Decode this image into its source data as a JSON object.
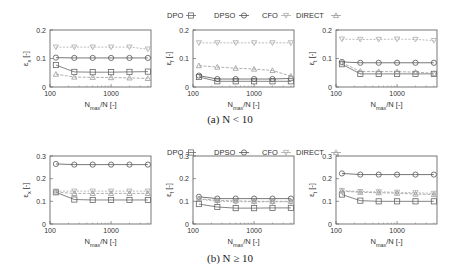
{
  "legend": [
    {
      "name": "DPO",
      "marker": "square",
      "color": "#666666"
    },
    {
      "name": "DPSO",
      "marker": "circle",
      "color": "#555555"
    },
    {
      "name": "CFO",
      "marker": "triangle-down",
      "color": "#aaaaaa"
    },
    {
      "name": "DIRECT",
      "marker": "triangle-up",
      "color": "#999999"
    }
  ],
  "captions": [
    "(a) N < 10",
    "(b) N ≥ 10"
  ],
  "chart_data": [
    {
      "type": "line",
      "row": 0,
      "ylabel": "εx [-]",
      "xlabel": "Nmax/N [-]",
      "xscale": "log",
      "xlim": [
        100,
        4500
      ],
      "ylim": [
        0,
        0.2
      ],
      "xticks": [
        100,
        1000
      ],
      "xtick_labels": [
        "100",
        "1000"
      ],
      "yticks": [
        0,
        0.1,
        0.2
      ],
      "ytick_labels": [
        "0",
        "0.1",
        "0.2"
      ],
      "x": [
        125,
        250,
        500,
        1000,
        2000,
        4000
      ],
      "series": [
        {
          "name": "DPO",
          "values": [
            0.077,
            0.053,
            0.052,
            0.052,
            0.053,
            0.054
          ]
        },
        {
          "name": "DPSO",
          "values": [
            0.103,
            0.102,
            0.102,
            0.102,
            0.102,
            0.102
          ]
        },
        {
          "name": "CFO",
          "values": [
            0.14,
            0.14,
            0.14,
            0.14,
            0.14,
            0.133
          ]
        },
        {
          "name": "DIRECT",
          "values": [
            0.045,
            0.035,
            0.034,
            0.033,
            0.032,
            0.03
          ]
        }
      ]
    },
    {
      "type": "line",
      "row": 0,
      "ylabel": "εf [-]",
      "xlabel": "Nmax/N [-]",
      "xscale": "log",
      "xlim": [
        100,
        4500
      ],
      "ylim": [
        0,
        0.2
      ],
      "xticks": [
        100,
        1000
      ],
      "xtick_labels": [
        "100",
        "1000"
      ],
      "yticks": [
        0,
        0.1,
        0.2
      ],
      "ytick_labels": [
        "0",
        "0.1",
        "0.2"
      ],
      "x": [
        125,
        250,
        500,
        1000,
        2000,
        4000
      ],
      "series": [
        {
          "name": "DPO",
          "values": [
            0.035,
            0.02,
            0.02,
            0.02,
            0.02,
            0.02
          ]
        },
        {
          "name": "DPSO",
          "values": [
            0.04,
            0.028,
            0.028,
            0.028,
            0.028,
            0.03
          ]
        },
        {
          "name": "CFO",
          "values": [
            0.155,
            0.155,
            0.155,
            0.155,
            0.155,
            0.155
          ]
        },
        {
          "name": "DIRECT",
          "values": [
            0.075,
            0.07,
            0.066,
            0.063,
            0.058,
            0.038
          ]
        }
      ]
    },
    {
      "type": "line",
      "row": 0,
      "ylabel": "εt [-]",
      "xlabel": "Nmax/N [-]",
      "xscale": "log",
      "xlim": [
        100,
        4500
      ],
      "ylim": [
        0,
        0.2
      ],
      "xticks": [
        100,
        1000
      ],
      "xtick_labels": [
        "100",
        "1000"
      ],
      "yticks": [
        0,
        0.1,
        0.2
      ],
      "ytick_labels": [
        "0",
        "0.1",
        "0.2"
      ],
      "x": [
        125,
        250,
        500,
        1000,
        2000,
        4000
      ],
      "series": [
        {
          "name": "DPO",
          "values": [
            0.08,
            0.046,
            0.046,
            0.046,
            0.046,
            0.046
          ]
        },
        {
          "name": "DPSO",
          "values": [
            0.088,
            0.085,
            0.085,
            0.085,
            0.085,
            0.085
          ]
        },
        {
          "name": "CFO",
          "values": [
            0.168,
            0.167,
            0.167,
            0.168,
            0.167,
            0.163
          ]
        },
        {
          "name": "DIRECT",
          "values": [
            0.085,
            0.055,
            0.054,
            0.054,
            0.052,
            0.048
          ]
        }
      ]
    },
    {
      "type": "line",
      "row": 1,
      "ylabel": "εx [-]",
      "xlabel": "Nmax/N [-]",
      "xscale": "log",
      "xlim": [
        100,
        4500
      ],
      "ylim": [
        0,
        0.3
      ],
      "xticks": [
        100,
        1000
      ],
      "xtick_labels": [
        "100",
        "1000"
      ],
      "yticks": [
        0,
        0.1,
        0.2,
        0.3
      ],
      "ytick_labels": [
        "0",
        "0.1",
        "0.2",
        "0.3"
      ],
      "x": [
        125,
        250,
        500,
        1000,
        2000,
        4000
      ],
      "series": [
        {
          "name": "DPO",
          "values": [
            0.14,
            0.108,
            0.106,
            0.106,
            0.106,
            0.106
          ]
        },
        {
          "name": "DPSO",
          "values": [
            0.265,
            0.262,
            0.262,
            0.262,
            0.262,
            0.262
          ]
        },
        {
          "name": "CFO",
          "values": [
            0.145,
            0.145,
            0.145,
            0.145,
            0.145,
            0.145
          ]
        },
        {
          "name": "DIRECT",
          "values": [
            0.14,
            0.135,
            0.135,
            0.135,
            0.135,
            0.135
          ]
        }
      ]
    },
    {
      "type": "line",
      "row": 1,
      "ylabel": "εf [-]",
      "xlabel": "Nmax/N [-]",
      "xscale": "log",
      "xlim": [
        100,
        4500
      ],
      "ylim": [
        0,
        0.3
      ],
      "xticks": [
        100,
        1000
      ],
      "xtick_labels": [
        "100",
        "1000"
      ],
      "yticks": [
        0,
        0.1,
        0.2,
        0.3
      ],
      "ytick_labels": [
        "0",
        "0.1",
        "0.2",
        "0.3"
      ],
      "x": [
        125,
        250,
        500,
        1000,
        2000,
        4000
      ],
      "series": [
        {
          "name": "DPO",
          "values": [
            0.088,
            0.075,
            0.07,
            0.07,
            0.071,
            0.071
          ]
        },
        {
          "name": "DPSO",
          "values": [
            0.12,
            0.112,
            0.112,
            0.112,
            0.112,
            0.112
          ]
        },
        {
          "name": "CFO",
          "values": [
            0.11,
            0.1,
            0.098,
            0.098,
            0.098,
            0.098
          ]
        },
        {
          "name": "DIRECT",
          "values": [
            0.112,
            0.104,
            0.102,
            0.1,
            0.1,
            0.1
          ]
        }
      ]
    },
    {
      "type": "line",
      "row": 1,
      "ylabel": "εt [-]",
      "xlabel": "Nmax/N [-]",
      "xscale": "log",
      "xlim": [
        100,
        4500
      ],
      "ylim": [
        0,
        0.3
      ],
      "xticks": [
        100,
        1000
      ],
      "xtick_labels": [
        "100",
        "1000"
      ],
      "yticks": [
        0,
        0.1,
        0.2,
        0.3
      ],
      "ytick_labels": [
        "0",
        "0.1",
        "0.2",
        "0.3"
      ],
      "x": [
        125,
        250,
        500,
        1000,
        2000,
        4000
      ],
      "series": [
        {
          "name": "DPO",
          "values": [
            0.13,
            0.103,
            0.1,
            0.1,
            0.1,
            0.1
          ]
        },
        {
          "name": "DPSO",
          "values": [
            0.223,
            0.218,
            0.218,
            0.218,
            0.218,
            0.218
          ]
        },
        {
          "name": "CFO",
          "values": [
            0.148,
            0.143,
            0.142,
            0.14,
            0.138,
            0.135
          ]
        },
        {
          "name": "DIRECT",
          "values": [
            0.145,
            0.14,
            0.138,
            0.136,
            0.132,
            0.13
          ]
        }
      ]
    }
  ]
}
